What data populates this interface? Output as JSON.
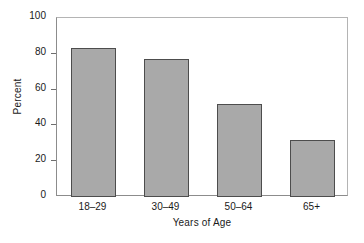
{
  "chart_data": {
    "type": "bar",
    "title": "",
    "subtitle": "",
    "xlabel": "Years of Age",
    "ylabel": "Percent",
    "categories": [
      "18–29",
      "30–49",
      "50–64",
      "65+"
    ],
    "values": [
      83,
      77,
      52,
      32
    ],
    "ylim": [
      0,
      100
    ],
    "yticks": [
      0,
      20,
      40,
      60,
      80,
      100
    ],
    "ytick_labels": [
      "0",
      "20",
      "40",
      "60",
      "80",
      "100"
    ],
    "grid": false,
    "legend": null,
    "annotations": [],
    "colors": {
      "bar_fill": "#a9a9a9",
      "bar_edge": "#4d4d4d",
      "axis": "#8c8c8c",
      "text": "#1a1a1a",
      "background": "#ffffff"
    }
  }
}
